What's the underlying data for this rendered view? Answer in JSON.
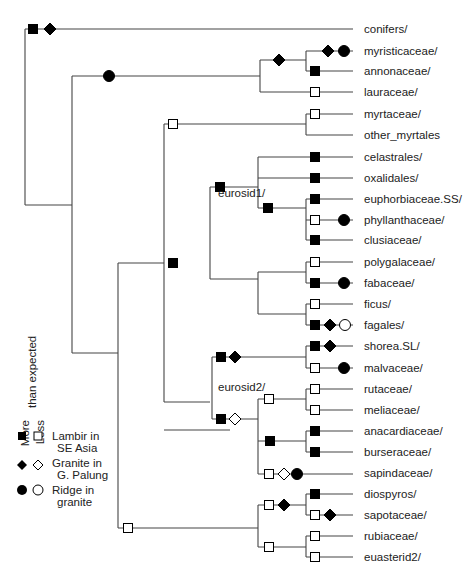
{
  "legend": {
    "axis_title": "than expected",
    "col_more": "More",
    "col_less": "Less",
    "rows": [
      {
        "shape": "square",
        "line1": "Lambir in",
        "line2": "SE Asia"
      },
      {
        "shape": "diamond",
        "line1": "Granite in",
        "line2": "G. Palung"
      },
      {
        "shape": "circle",
        "line1": "Ridge in",
        "line2": "granite"
      }
    ]
  },
  "clade_labels": {
    "eurosid1": "eurosid1/",
    "eurosid2": "eurosid2/"
  },
  "leaves": [
    {
      "name": "conifers/",
      "y": 29
    },
    {
      "name": "myristicaceae/",
      "y": 51
    },
    {
      "name": "annonaceae/",
      "y": 71
    },
    {
      "name": "lauraceae/",
      "y": 92
    },
    {
      "name": "myrtaceae/",
      "y": 114
    },
    {
      "name": "other_myrtales",
      "y": 135
    },
    {
      "name": "celastrales/",
      "y": 157
    },
    {
      "name": "oxalidales/",
      "y": 178
    },
    {
      "name": "euphorbiaceae.SS/",
      "y": 199
    },
    {
      "name": "phyllanthaceae/",
      "y": 220
    },
    {
      "name": "clusiaceae/",
      "y": 240
    },
    {
      "name": "polygalaceae/",
      "y": 262
    },
    {
      "name": "fabaceae/",
      "y": 283
    },
    {
      "name": "ficus/",
      "y": 304
    },
    {
      "name": "fagales/",
      "y": 325
    },
    {
      "name": "shorea.SL/",
      "y": 346
    },
    {
      "name": "malvaceae/",
      "y": 368
    },
    {
      "name": "rutaceae/",
      "y": 389
    },
    {
      "name": "meliaceae/",
      "y": 410
    },
    {
      "name": "anacardiaceae/",
      "y": 431
    },
    {
      "name": "burseraceae/",
      "y": 452
    },
    {
      "name": "sapindaceae/",
      "y": 473
    },
    {
      "name": "diospyros/",
      "y": 494
    },
    {
      "name": "sapotaceae/",
      "y": 515
    },
    {
      "name": "rubiaceae/",
      "y": 536
    },
    {
      "name": "euasterid2/",
      "y": 557
    }
  ],
  "edges": [
    [
      25,
      29,
      353,
      29
    ],
    [
      25,
      29,
      25,
      205
    ],
    [
      25,
      205,
      72,
      205
    ],
    [
      72,
      76,
      72,
      353
    ],
    [
      72,
      76,
      260,
      76
    ],
    [
      260,
      60,
      260,
      92
    ],
    [
      260,
      60,
      306,
      60
    ],
    [
      306,
      51,
      306,
      71
    ],
    [
      306,
      51,
      353,
      51
    ],
    [
      306,
      71,
      353,
      71
    ],
    [
      260,
      92,
      353,
      92
    ],
    [
      72,
      353,
      118,
      353
    ],
    [
      118,
      263,
      118,
      528
    ],
    [
      118,
      263,
      164,
      263
    ],
    [
      164,
      124,
      164,
      402
    ],
    [
      164,
      124,
      306,
      124
    ],
    [
      306,
      114,
      306,
      135
    ],
    [
      306,
      114,
      353,
      114
    ],
    [
      306,
      135,
      353,
      135
    ],
    [
      164,
      402,
      210,
      402
    ],
    [
      210,
      187,
      210,
      279
    ],
    [
      210,
      187,
      258,
      187
    ],
    [
      258,
      157,
      258,
      208
    ],
    [
      258,
      157,
      353,
      157
    ],
    [
      258,
      178,
      353,
      178
    ],
    [
      258,
      208,
      306,
      208
    ],
    [
      306,
      199,
      306,
      240
    ],
    [
      306,
      199,
      353,
      199
    ],
    [
      306,
      220,
      353,
      220
    ],
    [
      306,
      240,
      353,
      240
    ],
    [
      210,
      279,
      258,
      279
    ],
    [
      258,
      272,
      258,
      314
    ],
    [
      258,
      272,
      306,
      272
    ],
    [
      306,
      262,
      306,
      283
    ],
    [
      306,
      262,
      353,
      262
    ],
    [
      306,
      283,
      353,
      283
    ],
    [
      258,
      314,
      306,
      314
    ],
    [
      306,
      304,
      306,
      325
    ],
    [
      306,
      304,
      353,
      304
    ],
    [
      306,
      325,
      353,
      325
    ],
    [
      164,
      430,
      230,
      430
    ],
    [
      212,
      357,
      212,
      419
    ],
    [
      212,
      357,
      306,
      357
    ],
    [
      306,
      346,
      306,
      368
    ],
    [
      306,
      346,
      353,
      346
    ],
    [
      306,
      368,
      353,
      368
    ],
    [
      212,
      419,
      258,
      419
    ],
    [
      258,
      399,
      258,
      474
    ],
    [
      258,
      399,
      306,
      399
    ],
    [
      306,
      389,
      306,
      410
    ],
    [
      306,
      389,
      353,
      389
    ],
    [
      306,
      410,
      353,
      410
    ],
    [
      258,
      441,
      306,
      441
    ],
    [
      306,
      431,
      306,
      452
    ],
    [
      306,
      431,
      353,
      431
    ],
    [
      306,
      452,
      353,
      452
    ],
    [
      258,
      474,
      353,
      474
    ],
    [
      118,
      528,
      258,
      528
    ],
    [
      258,
      505,
      258,
      547
    ],
    [
      258,
      505,
      306,
      505
    ],
    [
      306,
      494,
      306,
      515
    ],
    [
      306,
      494,
      353,
      494
    ],
    [
      306,
      515,
      353,
      515
    ],
    [
      258,
      547,
      306,
      547
    ],
    [
      306,
      536,
      306,
      557
    ],
    [
      306,
      536,
      353,
      536
    ],
    [
      306,
      557,
      353,
      557
    ]
  ],
  "markers": [
    {
      "shape": "square",
      "fill": "filled",
      "x": 33,
      "y": 29
    },
    {
      "shape": "diamond",
      "fill": "filled",
      "x": 50,
      "y": 29
    },
    {
      "shape": "circle",
      "fill": "filled",
      "x": 109,
      "y": 76
    },
    {
      "shape": "diamond",
      "fill": "filled",
      "x": 279,
      "y": 60
    },
    {
      "shape": "diamond",
      "fill": "filled",
      "x": 328,
      "y": 51
    },
    {
      "shape": "circle",
      "fill": "filled",
      "x": 344,
      "y": 51
    },
    {
      "shape": "square",
      "fill": "filled",
      "x": 315,
      "y": 71
    },
    {
      "shape": "square",
      "fill": "open",
      "x": 315,
      "y": 92
    },
    {
      "shape": "square",
      "fill": "open",
      "x": 173,
      "y": 124
    },
    {
      "shape": "square",
      "fill": "open",
      "x": 315,
      "y": 114
    },
    {
      "shape": "square",
      "fill": "filled",
      "x": 173,
      "y": 263
    },
    {
      "shape": "square",
      "fill": "filled",
      "x": 220,
      "y": 187
    },
    {
      "shape": "square",
      "fill": "filled",
      "x": 315,
      "y": 157
    },
    {
      "shape": "square",
      "fill": "filled",
      "x": 315,
      "y": 178
    },
    {
      "shape": "square",
      "fill": "filled",
      "x": 268,
      "y": 208
    },
    {
      "shape": "square",
      "fill": "filled",
      "x": 315,
      "y": 199
    },
    {
      "shape": "square",
      "fill": "open",
      "x": 315,
      "y": 220
    },
    {
      "shape": "circle",
      "fill": "filled",
      "x": 344,
      "y": 220
    },
    {
      "shape": "square",
      "fill": "filled",
      "x": 315,
      "y": 240
    },
    {
      "shape": "square",
      "fill": "open",
      "x": 315,
      "y": 262
    },
    {
      "shape": "square",
      "fill": "filled",
      "x": 315,
      "y": 283
    },
    {
      "shape": "circle",
      "fill": "filled",
      "x": 344,
      "y": 283
    },
    {
      "shape": "square",
      "fill": "open",
      "x": 315,
      "y": 304
    },
    {
      "shape": "square",
      "fill": "filled",
      "x": 315,
      "y": 325
    },
    {
      "shape": "diamond",
      "fill": "filled",
      "x": 330,
      "y": 325
    },
    {
      "shape": "circle",
      "fill": "open",
      "x": 345,
      "y": 325
    },
    {
      "shape": "square",
      "fill": "filled",
      "x": 221,
      "y": 357
    },
    {
      "shape": "diamond",
      "fill": "filled",
      "x": 235,
      "y": 357
    },
    {
      "shape": "square",
      "fill": "filled",
      "x": 315,
      "y": 346
    },
    {
      "shape": "diamond",
      "fill": "filled",
      "x": 330,
      "y": 346
    },
    {
      "shape": "square",
      "fill": "open",
      "x": 315,
      "y": 368
    },
    {
      "shape": "circle",
      "fill": "filled",
      "x": 344,
      "y": 368
    },
    {
      "shape": "square",
      "fill": "filled",
      "x": 221,
      "y": 419
    },
    {
      "shape": "diamond",
      "fill": "open",
      "x": 235,
      "y": 419
    },
    {
      "shape": "square",
      "fill": "open",
      "x": 269,
      "y": 399
    },
    {
      "shape": "square",
      "fill": "open",
      "x": 315,
      "y": 389
    },
    {
      "shape": "square",
      "fill": "open",
      "x": 315,
      "y": 410
    },
    {
      "shape": "square",
      "fill": "filled",
      "x": 270,
      "y": 441
    },
    {
      "shape": "square",
      "fill": "filled",
      "x": 315,
      "y": 431
    },
    {
      "shape": "square",
      "fill": "filled",
      "x": 315,
      "y": 452
    },
    {
      "shape": "square",
      "fill": "open",
      "x": 269,
      "y": 474
    },
    {
      "shape": "diamond",
      "fill": "open",
      "x": 284,
      "y": 474
    },
    {
      "shape": "circle",
      "fill": "filled",
      "x": 297,
      "y": 474
    },
    {
      "shape": "square",
      "fill": "open",
      "x": 128,
      "y": 528
    },
    {
      "shape": "square",
      "fill": "open",
      "x": 269,
      "y": 505
    },
    {
      "shape": "diamond",
      "fill": "filled",
      "x": 284,
      "y": 505
    },
    {
      "shape": "square",
      "fill": "filled",
      "x": 315,
      "y": 494
    },
    {
      "shape": "square",
      "fill": "open",
      "x": 315,
      "y": 515
    },
    {
      "shape": "diamond",
      "fill": "filled",
      "x": 330,
      "y": 515
    },
    {
      "shape": "square",
      "fill": "open",
      "x": 269,
      "y": 547
    },
    {
      "shape": "square",
      "fill": "open",
      "x": 315,
      "y": 536
    },
    {
      "shape": "square",
      "fill": "open",
      "x": 315,
      "y": 557
    }
  ],
  "colors": {
    "line": "#444444",
    "marker": "#000000",
    "text": "#222222",
    "background": "#ffffff"
  }
}
